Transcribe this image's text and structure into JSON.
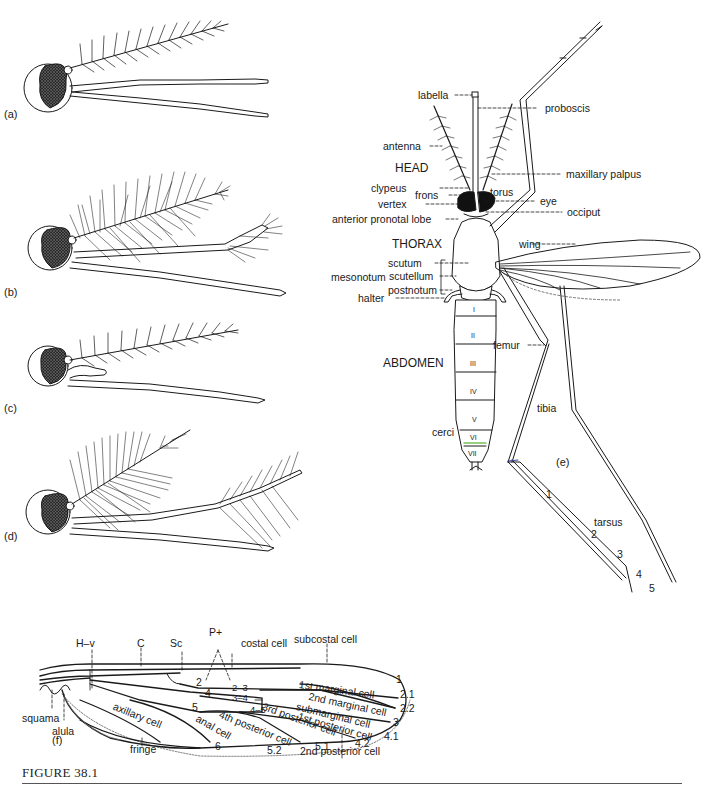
{
  "figure": {
    "caption": "FIGURE 38.1",
    "panels": {
      "a": "(a)",
      "b": "(b)",
      "c": "(c)",
      "d": "(d)",
      "e": "(e)",
      "f": "(f)"
    }
  },
  "panel_e": {
    "sections": {
      "head": "HEAD",
      "thorax": "THORAX",
      "abdomen": "ABDOMEN"
    },
    "labels": {
      "labella": "labella",
      "proboscis": "proboscis",
      "antenna": "antenna",
      "maxillary_palpus": "maxillary palpus",
      "clypeus": "clypeus",
      "torus": "torus",
      "frons": "frons",
      "eye": "eye",
      "vertex": "vertex",
      "occiput": "occiput",
      "anterior_pronotal_lobe": "anterior pronotal lobe",
      "wing": "wing",
      "mesonotum": "mesonotum",
      "scutum": "scutum",
      "scutellum": "scutellum",
      "postnotum": "postnotum",
      "halter": "halter",
      "femur": "femur",
      "tibia": "tibia",
      "cerci": "cerci",
      "tarsus": "tarsus"
    },
    "abdominal_segments": [
      "I",
      "II",
      "III",
      "IV",
      "V",
      "VI",
      "VII"
    ],
    "tarsal_segments": [
      "1",
      "2",
      "3",
      "4",
      "5"
    ]
  },
  "panel_f": {
    "labels": {
      "h_v": "H–v",
      "c": "C",
      "sc": "Sc",
      "p_plus": "P+",
      "costal_cell": "costal cell",
      "subcostal_cell": "subcostal cell",
      "first_marginal_cell": "1st marginal cell",
      "second_marginal_cell": "2nd marginal cell",
      "submarginal_cell": "submarginal cell",
      "first_posterior_cell": "1st posterior cell",
      "third_posterior_cell": "3rd posterior cell",
      "fourth_posterior_cell": "4th posterior cell",
      "second_posterior_cell": "2nd posterior cell",
      "axillary_cell": "axillary cell",
      "anal_cell": "anal cell",
      "squama": "squama",
      "alula": "alula",
      "fringe": "fringe"
    },
    "vein_numbers": {
      "v2": "2",
      "v2_3": "2–3",
      "v3_4": "3–4",
      "v4": "4",
      "v4_5": "4–5",
      "v5": "5",
      "v6": "6",
      "v1": "1",
      "v2_1": "2.1",
      "v2_2": "2.2",
      "v3": "3",
      "v4_1": "4.1",
      "v4_2": "4.2",
      "v5_1": "5.1",
      "v5_2": "5.2"
    }
  },
  "colors": {
    "ink": "#1a1a1a",
    "background": "#ffffff",
    "rule": "#555555"
  }
}
